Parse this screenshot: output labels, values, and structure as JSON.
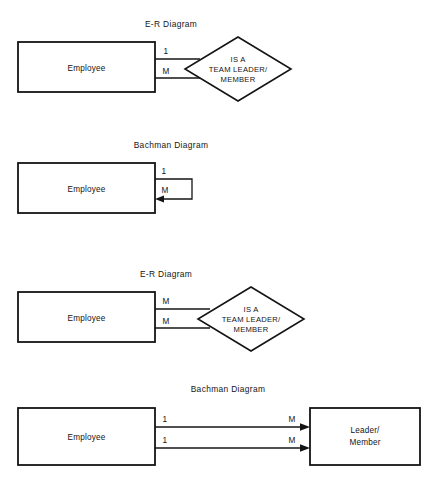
{
  "page": {
    "background_color": "#ffffff",
    "ink_color": "#141414",
    "width": 444,
    "height": 482
  },
  "figures": [
    {
      "id": "fig-1",
      "title": "E-R Diagram",
      "entity": "Employee",
      "relationship_lines": [
        "IS A",
        "TEAM LEADER/",
        "MEMBER"
      ],
      "cardinality_top": "1",
      "cardinality_bottom": "M",
      "notation": "er"
    },
    {
      "id": "fig-2",
      "title": "Bachman Diagram",
      "entity": "Employee",
      "cardinality_top": "1",
      "cardinality_bottom": "M",
      "notation": "bachman-recursive"
    },
    {
      "id": "fig-3",
      "title": "E-R Diagram",
      "entity": "Employee",
      "relationship_lines": [
        "IS A",
        "TEAM LEADER/",
        "MEMBER"
      ],
      "cardinality_top": "M",
      "cardinality_bottom": "M",
      "notation": "er"
    },
    {
      "id": "fig-4",
      "title": "Bachman Diagram",
      "entity_left": "Employee",
      "entity_right_lines": [
        "Leader/",
        "Member"
      ],
      "cardinality_left_top": "1",
      "cardinality_left_bottom": "1",
      "cardinality_right_top": "M",
      "cardinality_right_bottom": "M",
      "notation": "bachman-pair"
    }
  ]
}
